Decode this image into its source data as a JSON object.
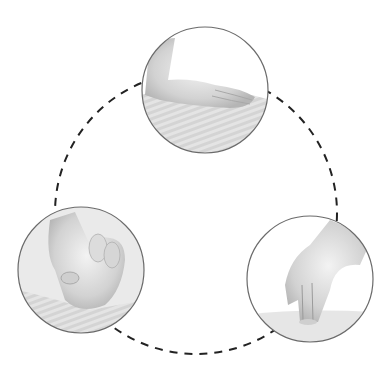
{
  "diagram": {
    "title": "",
    "connector": {
      "style": "dashed",
      "color": "#222222",
      "cx": 196,
      "cy": 213,
      "r": 141
    },
    "nodes": [
      {
        "id": "top",
        "label": "",
        "depicts": "hand resting flat on back (palm pressure)",
        "cx": 205,
        "cy": 90,
        "r": 63
      },
      {
        "id": "left",
        "label": "",
        "depicts": "knuckles / fist kneading",
        "cx": 81,
        "cy": 270,
        "r": 63
      },
      {
        "id": "right",
        "label": "",
        "depicts": "fingertip pressure",
        "cx": 310,
        "cy": 279,
        "r": 63
      }
    ],
    "colors": {
      "background": "#ffffff",
      "circle_border": "#6b6b6b",
      "photo_tone": "#d9d9d9"
    }
  }
}
